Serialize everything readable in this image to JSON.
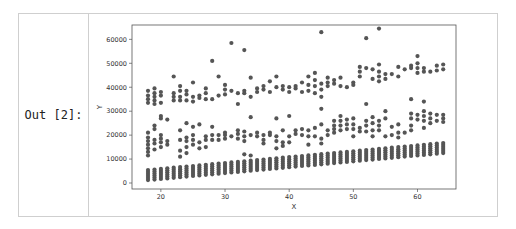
{
  "cell": {
    "prompt_label": "Out [2]:"
  },
  "colors": {
    "marker": "#555555",
    "axis": "#555555",
    "cell_border": "#cfcfcf"
  },
  "chart_data": {
    "type": "scatter",
    "title": "",
    "xlabel": "X",
    "ylabel": "Y",
    "xlim": [
      15.5,
      66
    ],
    "ylim": [
      -2500,
      66000
    ],
    "xticks": [
      20,
      30,
      40,
      50,
      60
    ],
    "yticks": [
      0,
      10000,
      20000,
      30000,
      40000,
      50000,
      60000
    ],
    "grid": false,
    "legend": null,
    "series": [
      {
        "name": "low_band",
        "description": "Dense column at each integer X from 18 to 64; Y spans roughly base..base+4000, base rising from ~1200 at X=18 to ~12500 at X=64",
        "x_range": [
          18,
          64
        ],
        "base_start": 1200,
        "base_end": 12500,
        "spread": 4200
      },
      {
        "name": "mid_band",
        "points": [
          [
            18,
            11500
          ],
          [
            18,
            13000
          ],
          [
            18,
            14500
          ],
          [
            18,
            16000
          ],
          [
            18,
            17500
          ],
          [
            18,
            19000
          ],
          [
            18,
            21000
          ],
          [
            19,
            14000
          ],
          [
            19,
            16500
          ],
          [
            19,
            18000
          ],
          [
            19,
            22500
          ],
          [
            19,
            24000
          ],
          [
            20,
            15000
          ],
          [
            20,
            17000
          ],
          [
            20,
            18500
          ],
          [
            20,
            20000
          ],
          [
            20,
            27000
          ],
          [
            20,
            28000
          ],
          [
            21,
            16000
          ],
          [
            21,
            17500
          ],
          [
            21,
            26500
          ],
          [
            23,
            11000
          ],
          [
            23,
            13500
          ],
          [
            23,
            18000
          ],
          [
            23,
            22000
          ],
          [
            24,
            12500
          ],
          [
            24,
            15000
          ],
          [
            24,
            17500
          ],
          [
            24,
            19000
          ],
          [
            24,
            25000
          ],
          [
            25,
            16000
          ],
          [
            25,
            18000
          ],
          [
            25,
            20000
          ],
          [
            25,
            23500
          ],
          [
            26,
            14500
          ],
          [
            26,
            17000
          ],
          [
            26,
            24500
          ],
          [
            27,
            15000
          ],
          [
            27,
            18000
          ],
          [
            27,
            19500
          ],
          [
            28,
            18000
          ],
          [
            28,
            20000
          ],
          [
            28,
            23500
          ],
          [
            29,
            18000
          ],
          [
            29,
            20000
          ],
          [
            30,
            18500
          ],
          [
            30,
            20000
          ],
          [
            30,
            21000
          ],
          [
            31,
            19500
          ],
          [
            32,
            18500
          ],
          [
            32,
            20500
          ],
          [
            32,
            22000
          ],
          [
            33,
            12000
          ],
          [
            33,
            17500
          ],
          [
            33,
            19500
          ],
          [
            33,
            21500
          ],
          [
            34,
            11500
          ],
          [
            34,
            20000
          ],
          [
            34,
            27500
          ],
          [
            35,
            19500
          ],
          [
            35,
            21000
          ],
          [
            36,
            16500
          ],
          [
            36,
            18000
          ],
          [
            36,
            20000
          ],
          [
            37,
            20000
          ],
          [
            37,
            21000
          ],
          [
            38,
            14500
          ],
          [
            38,
            17500
          ],
          [
            38,
            19500
          ],
          [
            38,
            27000
          ],
          [
            39,
            15500
          ],
          [
            39,
            17000
          ],
          [
            39,
            22000
          ],
          [
            40,
            17000
          ],
          [
            40,
            19500
          ],
          [
            40,
            28000
          ],
          [
            41,
            22000
          ],
          [
            41,
            20500
          ],
          [
            42,
            22500
          ],
          [
            42,
            20000
          ],
          [
            43,
            16000
          ],
          [
            43,
            19500
          ],
          [
            43,
            22000
          ],
          [
            44,
            19500
          ],
          [
            44,
            23000
          ],
          [
            45,
            16500
          ],
          [
            45,
            18500
          ],
          [
            45,
            24500
          ],
          [
            45,
            31000
          ],
          [
            46,
            20000
          ],
          [
            46,
            22000
          ],
          [
            47,
            21000
          ],
          [
            47,
            22500
          ],
          [
            47,
            24000
          ],
          [
            47,
            26000
          ],
          [
            48,
            22000
          ],
          [
            48,
            24000
          ],
          [
            48,
            26000
          ],
          [
            48,
            28000
          ],
          [
            49,
            22500
          ],
          [
            49,
            24500
          ],
          [
            49,
            26500
          ],
          [
            50,
            19500
          ],
          [
            50,
            22500
          ],
          [
            50,
            24500
          ],
          [
            50,
            27000
          ],
          [
            51,
            21500
          ],
          [
            51,
            23000
          ],
          [
            52,
            21500
          ],
          [
            52,
            24000
          ],
          [
            52,
            26000
          ],
          [
            52,
            33000
          ],
          [
            53,
            19500
          ],
          [
            53,
            22000
          ],
          [
            53,
            25000
          ],
          [
            53,
            27500
          ],
          [
            54,
            22000
          ],
          [
            54,
            24000
          ],
          [
            54,
            26000
          ],
          [
            55,
            19500
          ],
          [
            55,
            27000
          ],
          [
            55,
            30000
          ],
          [
            56,
            20000
          ],
          [
            56,
            23500
          ],
          [
            57,
            19000
          ],
          [
            57,
            21000
          ],
          [
            57,
            24500
          ],
          [
            58,
            21000
          ],
          [
            59,
            22000
          ],
          [
            59,
            24000
          ],
          [
            59,
            27000
          ],
          [
            59,
            29000
          ],
          [
            59,
            35000
          ],
          [
            60,
            26500
          ],
          [
            60,
            28500
          ],
          [
            61,
            23000
          ],
          [
            61,
            26000
          ],
          [
            61,
            28000
          ],
          [
            61,
            30000
          ],
          [
            61,
            34000
          ],
          [
            62,
            25000
          ],
          [
            62,
            27000
          ],
          [
            62,
            29000
          ],
          [
            63,
            26000
          ],
          [
            63,
            28500
          ],
          [
            64,
            25500
          ],
          [
            64,
            27000
          ],
          [
            64,
            28500
          ]
        ]
      },
      {
        "name": "high_band",
        "points": [
          [
            18,
            33500
          ],
          [
            18,
            35000
          ],
          [
            18,
            36500
          ],
          [
            18,
            38500
          ],
          [
            19,
            33000
          ],
          [
            19,
            34500
          ],
          [
            19,
            36000
          ],
          [
            19,
            37500
          ],
          [
            19,
            39500
          ],
          [
            20,
            33500
          ],
          [
            20,
            36500
          ],
          [
            20,
            38000
          ],
          [
            22,
            34500
          ],
          [
            22,
            36000
          ],
          [
            22,
            37500
          ],
          [
            22,
            44500
          ],
          [
            23,
            34500
          ],
          [
            23,
            36000
          ],
          [
            23,
            38500
          ],
          [
            23,
            40500
          ],
          [
            24,
            34500
          ],
          [
            24,
            37000
          ],
          [
            24,
            38500
          ],
          [
            25,
            34000
          ],
          [
            25,
            36000
          ],
          [
            25,
            42000
          ],
          [
            26,
            35500
          ],
          [
            26,
            36500
          ],
          [
            27,
            35000
          ],
          [
            27,
            37500
          ],
          [
            27,
            39500
          ],
          [
            28,
            35000
          ],
          [
            28,
            51000
          ],
          [
            29,
            36500
          ],
          [
            29,
            44500
          ],
          [
            30,
            37000
          ],
          [
            30,
            39000
          ],
          [
            30,
            41000
          ],
          [
            31,
            38500
          ],
          [
            31,
            58500
          ],
          [
            32,
            33000
          ],
          [
            32,
            37500
          ],
          [
            33,
            37500
          ],
          [
            33,
            38500
          ],
          [
            33,
            55500
          ],
          [
            34,
            36000
          ],
          [
            34,
            44000
          ],
          [
            35,
            38000
          ],
          [
            35,
            39500
          ],
          [
            36,
            39000
          ],
          [
            36,
            40500
          ],
          [
            37,
            38000
          ],
          [
            37,
            42500
          ],
          [
            38,
            40000
          ],
          [
            38,
            44500
          ],
          [
            39,
            40500
          ],
          [
            39,
            39000
          ],
          [
            40,
            40000
          ],
          [
            40,
            38000
          ],
          [
            41,
            39500
          ],
          [
            41,
            40500
          ],
          [
            42,
            42000
          ],
          [
            42,
            38000
          ],
          [
            43,
            38500
          ],
          [
            43,
            41000
          ],
          [
            43,
            44500
          ],
          [
            44,
            37500
          ],
          [
            44,
            40500
          ],
          [
            44,
            43000
          ],
          [
            44,
            46000
          ],
          [
            45,
            36000
          ],
          [
            45,
            39000
          ],
          [
            45,
            41500
          ],
          [
            45,
            63000
          ],
          [
            46,
            40500
          ],
          [
            46,
            42000
          ],
          [
            46,
            44000
          ],
          [
            47,
            41500
          ],
          [
            47,
            43000
          ],
          [
            48,
            40500
          ],
          [
            48,
            44000
          ],
          [
            49,
            40000
          ],
          [
            50,
            41000
          ],
          [
            50,
            42000
          ],
          [
            51,
            44500
          ],
          [
            51,
            46500
          ],
          [
            51,
            48500
          ],
          [
            52,
            48000
          ],
          [
            52,
            60500
          ],
          [
            53,
            43500
          ],
          [
            53,
            47500
          ],
          [
            54,
            42500
          ],
          [
            54,
            44500
          ],
          [
            54,
            46500
          ],
          [
            54,
            49500
          ],
          [
            54,
            64500
          ],
          [
            55,
            43500
          ],
          [
            55,
            45500
          ],
          [
            56,
            45500
          ],
          [
            57,
            44500
          ],
          [
            57,
            48500
          ],
          [
            58,
            47500
          ],
          [
            59,
            48000
          ],
          [
            59,
            49000
          ],
          [
            60,
            46000
          ],
          [
            60,
            48000
          ],
          [
            60,
            50000
          ],
          [
            60,
            53000
          ],
          [
            61,
            46500
          ],
          [
            61,
            48000
          ],
          [
            62,
            46500
          ],
          [
            63,
            47000
          ],
          [
            63,
            49000
          ],
          [
            64,
            47500
          ],
          [
            64,
            49500
          ]
        ]
      }
    ]
  }
}
